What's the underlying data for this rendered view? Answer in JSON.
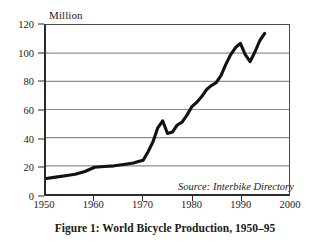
{
  "figure": {
    "unit_label": "Million",
    "caption": "Figure 1: World Bicycle Production, 1950–95",
    "source_note": "Source: Interbike Directory"
  },
  "style": {
    "line_color": "#111111",
    "grid_color": "#8e8e8e",
    "axis_color": "#2b2b2b",
    "background": "#ffffff",
    "line_width": 3.1
  },
  "chart_data": {
    "type": "line",
    "title": "Figure 1: World Bicycle Production, 1950–95",
    "xlabel": "",
    "ylabel": "Million",
    "xlim": [
      1950,
      2000
    ],
    "ylim": [
      0,
      120
    ],
    "xticks": [
      1950,
      1960,
      1970,
      1980,
      1990,
      2000
    ],
    "yticks": [
      0,
      20,
      40,
      60,
      80,
      100,
      120
    ],
    "grid": true,
    "legend": false,
    "annotations": [
      "Source: Interbike Directory"
    ],
    "series": [
      {
        "name": "World bicycle production",
        "x": [
          1950,
          1952,
          1954,
          1956,
          1958,
          1960,
          1962,
          1964,
          1966,
          1968,
          1969,
          1970,
          1971,
          1972,
          1973,
          1974,
          1975,
          1976,
          1977,
          1978,
          1979,
          1980,
          1981,
          1982,
          1983,
          1984,
          1985,
          1986,
          1987,
          1988,
          1989,
          1990,
          1991,
          1992,
          1993,
          1994,
          1995
        ],
        "values": [
          11,
          12,
          13,
          14,
          16,
          19,
          19.5,
          20,
          21,
          22,
          23,
          24,
          30,
          37,
          47,
          52,
          43,
          44,
          49,
          51,
          56,
          62,
          65,
          69,
          74,
          77,
          79,
          84,
          92,
          99,
          104,
          107,
          99,
          94,
          101,
          109,
          114
        ]
      }
    ]
  }
}
